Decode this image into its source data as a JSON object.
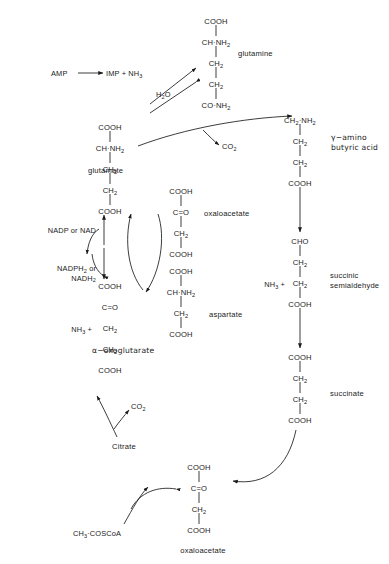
{
  "diagram": {
    "type": "biochemical-pathway",
    "background_color": "#ffffff",
    "line_color": "#1a1a1a"
  },
  "structures": {
    "glutamine": {
      "name": "glutamine",
      "atoms": [
        "COOH",
        "CH·NH2",
        "CH2",
        "CH2",
        "CO·NH2"
      ],
      "lines": [
        {
          "main": "COOH",
          "sub": ""
        },
        {
          "main": "CH·NH",
          "sub": "2"
        },
        {
          "main": "CH",
          "sub": "2"
        },
        {
          "main": "CH",
          "sub": "2"
        },
        {
          "main": "CO·NH",
          "sub": "2"
        }
      ]
    },
    "glutamate": {
      "name": "glutamate",
      "lines": [
        {
          "main": "COOH",
          "sub": ""
        },
        {
          "main": "CH·NH",
          "sub": "2"
        },
        {
          "main": "CH",
          "sub": "2"
        },
        {
          "main": "CH",
          "sub": "2"
        },
        {
          "main": "COOH",
          "sub": ""
        }
      ]
    },
    "alpha_oxoglutarate": {
      "name": "α−oxoglutarate",
      "prefix": "NH3 +",
      "lines": [
        {
          "main": "COOH",
          "sub": ""
        },
        {
          "main": "C=O",
          "sub": ""
        },
        {
          "main": "CH",
          "sub": "2"
        },
        {
          "main": "CH",
          "sub": "2"
        },
        {
          "main": "COOH",
          "sub": ""
        }
      ]
    },
    "oxaloacetate_middle": {
      "name": "oxaloacetate",
      "lines": [
        {
          "main": "COOH",
          "sub": ""
        },
        {
          "main": "C=O",
          "sub": ""
        },
        {
          "main": "CH",
          "sub": "2"
        },
        {
          "main": "COOH",
          "sub": ""
        }
      ]
    },
    "aspartate": {
      "name": "aspartate",
      "lines": [
        {
          "main": "COOH",
          "sub": ""
        },
        {
          "main": "CH·NH",
          "sub": "2"
        },
        {
          "main": "CH",
          "sub": "2"
        },
        {
          "main": "COOH",
          "sub": ""
        }
      ]
    },
    "gaba": {
      "name_line1": "γ−amino",
      "name_line2": "butyric acid",
      "lines": [
        {
          "main": "CH2·NH2",
          "sub": ""
        },
        {
          "main": "CH",
          "sub": "2"
        },
        {
          "main": "CH",
          "sub": "2"
        },
        {
          "main": "COOH",
          "sub": ""
        }
      ]
    },
    "succinic_semialdehyde": {
      "name_line1": "succinic",
      "name_line2": "semialdehyde",
      "prefix": "NH3 +",
      "lines": [
        {
          "main": "CHO",
          "sub": ""
        },
        {
          "main": "CH",
          "sub": "2"
        },
        {
          "main": "CH",
          "sub": "2"
        },
        {
          "main": "COOH",
          "sub": ""
        }
      ]
    },
    "succinate": {
      "name": "succinate",
      "lines": [
        {
          "main": "COOH",
          "sub": ""
        },
        {
          "main": "CH",
          "sub": "2"
        },
        {
          "main": "CH",
          "sub": "2"
        },
        {
          "main": "COOH",
          "sub": ""
        }
      ]
    },
    "oxaloacetate_bottom": {
      "name": "oxaloacetate",
      "lines": [
        {
          "main": "COOH",
          "sub": ""
        },
        {
          "main": "C=O",
          "sub": ""
        },
        {
          "main": "CH",
          "sub": "2"
        },
        {
          "main": "COOH",
          "sub": ""
        }
      ]
    },
    "citrate": {
      "name": "Citrate"
    }
  },
  "reactions": {
    "amp": "AMP",
    "imp_nh3": "IMP + NH3",
    "water": "H2O",
    "co2_decarboxylation": "CO2",
    "co2_citrate": "CO2",
    "acetyl_coa": "CH3·COSCoA",
    "nadp_or_nad": "NADP or NAD",
    "nadph2_line1": "NADPH2 or",
    "nadph2_line2": "NADH2"
  }
}
